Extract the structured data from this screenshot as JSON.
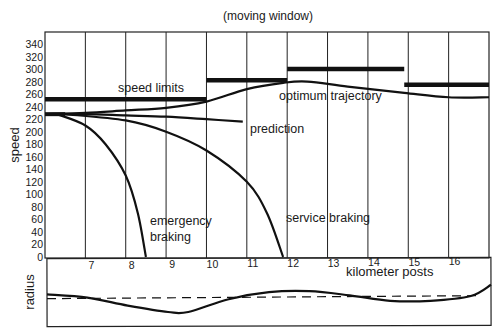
{
  "chart_data": [
    {
      "type": "line",
      "title": "(moving window)",
      "xlabel": "kilometer posts",
      "ylabel": "speed",
      "ylim": [
        0,
        340
      ],
      "yticks": [
        0,
        20,
        40,
        60,
        80,
        100,
        120,
        140,
        160,
        180,
        200,
        220,
        240,
        260,
        280,
        300,
        320,
        340
      ],
      "xticks": [
        "7",
        "8",
        "9",
        "10",
        "11",
        "12",
        "13",
        "14",
        "15",
        "16"
      ],
      "xlim": [
        6,
        17
      ],
      "grid": "vertical lines at each kilometer post",
      "annotations": [
        "speed limits",
        "optimum trajectory",
        "prediction",
        "emergency braking",
        "service braking"
      ],
      "series": [
        {
          "name": "speed limits",
          "style": "thick bold step",
          "segments": [
            {
              "x_from": 6.0,
              "x_to": 10.0,
              "speed": 252
            },
            {
              "x_from": 10.0,
              "x_to": 12.0,
              "speed": 282
            },
            {
              "x_from": 12.0,
              "x_to": 14.9,
              "speed": 300
            },
            {
              "x_from": 14.9,
              "x_to": 17.0,
              "speed": 275
            }
          ]
        },
        {
          "name": "optimum trajectory",
          "x": [
            6.0,
            7.0,
            8.0,
            9.0,
            10.0,
            11.0,
            11.9,
            12.5,
            13.5,
            14.9,
            16.0,
            17.0
          ],
          "values": [
            228,
            230,
            234,
            238,
            248,
            268,
            278,
            280,
            272,
            262,
            255,
            255
          ]
        },
        {
          "name": "prediction",
          "x": [
            6.0,
            7.0,
            8.0,
            9.0,
            10.0,
            10.9
          ],
          "values": [
            228,
            228,
            226,
            224,
            220,
            216
          ]
        },
        {
          "name": "emergency braking",
          "x": [
            6.3,
            7.0,
            7.5,
            8.0,
            8.3,
            8.5
          ],
          "values": [
            228,
            210,
            180,
            130,
            70,
            0
          ]
        },
        {
          "name": "service braking",
          "x": [
            6.5,
            8.0,
            9.0,
            10.0,
            11.0,
            11.5,
            11.9
          ],
          "values": [
            228,
            218,
            200,
            170,
            120,
            70,
            0
          ]
        }
      ]
    },
    {
      "type": "line",
      "ylabel": "radius",
      "series": [
        {
          "name": "track radius (solid)",
          "x": [
            6.0,
            7.0,
            8.0,
            9.0,
            9.5,
            10.5,
            11.5,
            12.5,
            13.5,
            14.5,
            15.5,
            16.5,
            17.0
          ],
          "values": [
            0.55,
            0.45,
            0.2,
            0.0,
            0.0,
            0.4,
            0.62,
            0.65,
            0.52,
            0.35,
            0.35,
            0.5,
            0.85
          ]
        },
        {
          "name": "reference (dashed)",
          "values_constant": 0.48
        }
      ]
    }
  ],
  "labels": {
    "title": "(moving window)",
    "speed_axis": "speed",
    "radius_axis": "radius",
    "x_axis": "kilometer posts",
    "speed_limits": "speed limits",
    "optimum": "optimum trajectory",
    "prediction": "prediction",
    "emergency_1": "emergency",
    "emergency_2": "braking",
    "service": "service braking"
  }
}
